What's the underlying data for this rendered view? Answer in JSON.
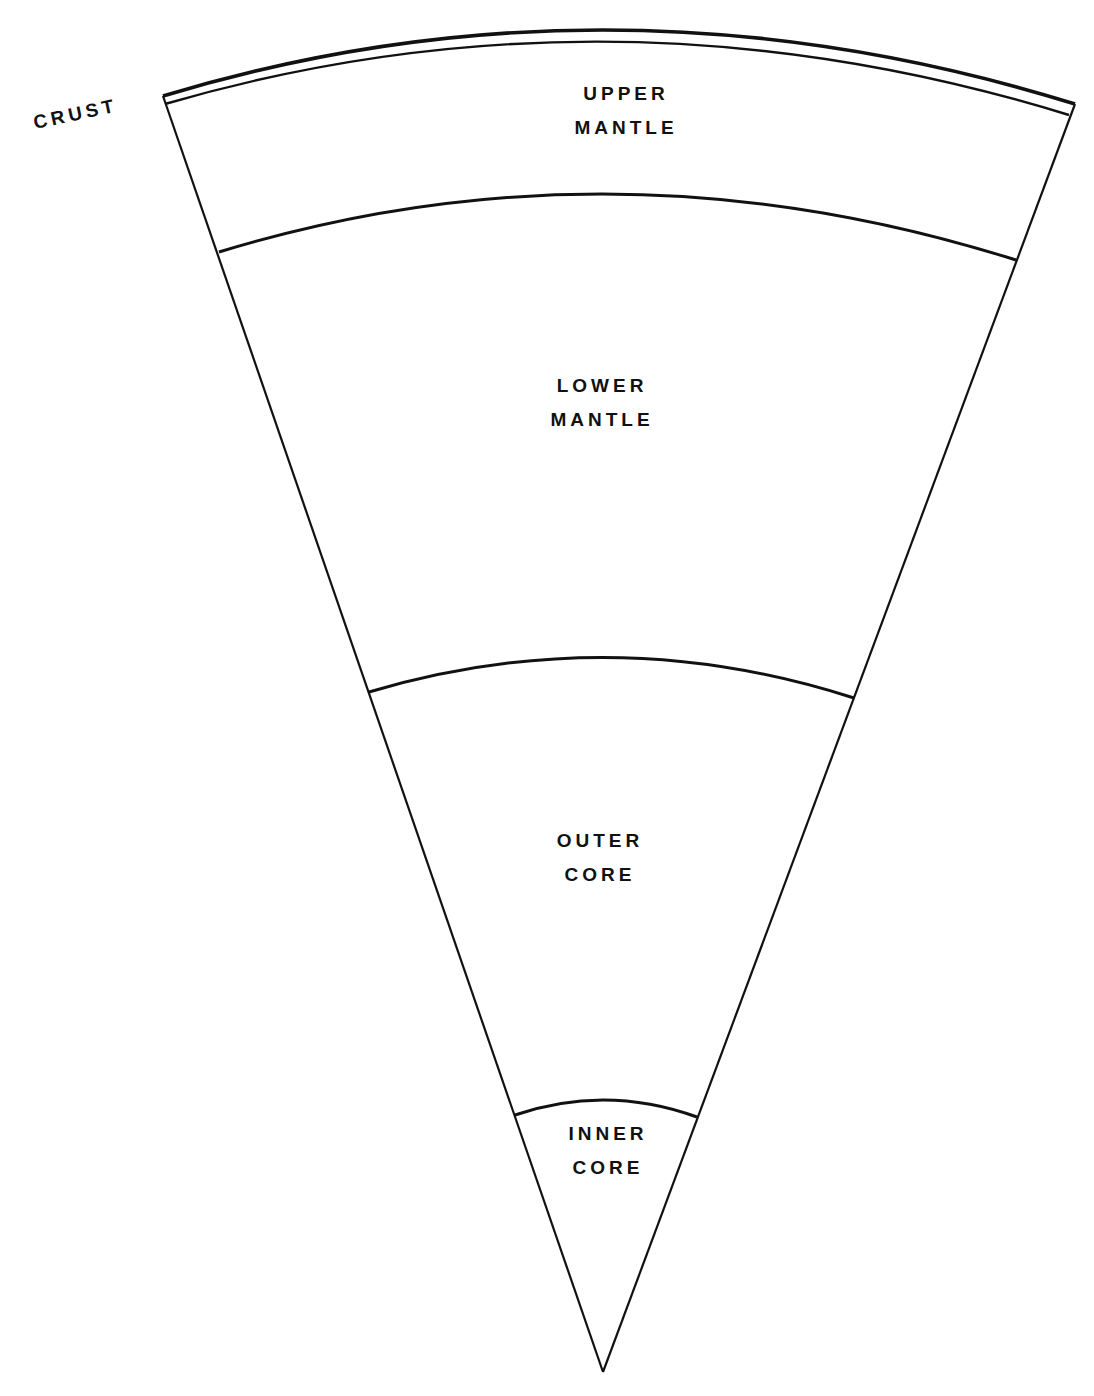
{
  "diagram": {
    "title": "",
    "stroke_color": "#111111",
    "background_color": "#ffffff",
    "layers": [
      {
        "id": "crust",
        "label_lines": [
          "CRUST"
        ]
      },
      {
        "id": "upper-mantle",
        "label_lines": [
          "UPPER",
          "MANTLE"
        ]
      },
      {
        "id": "lower-mantle",
        "label_lines": [
          "LOWER",
          "MANTLE"
        ]
      },
      {
        "id": "outer-core",
        "label_lines": [
          "OUTER",
          "CORE"
        ]
      },
      {
        "id": "inner-core",
        "label_lines": [
          "INNER",
          "CORE"
        ]
      }
    ]
  }
}
